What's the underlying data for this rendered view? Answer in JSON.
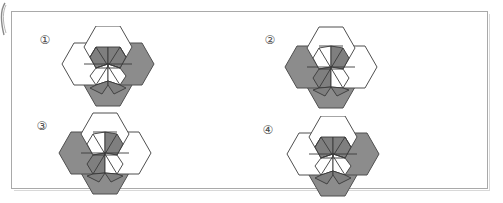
{
  "page": {
    "background_color": "#ffffff",
    "frame": {
      "border_color": "#a9a9a9",
      "shadow_color": "#d8d8d8"
    }
  },
  "palette": {
    "outline": "#4f4f4f",
    "inner_outline": "#3a3a3a",
    "shaded_fill": "#8c8c8c",
    "segment_dark": "#7f7f7f",
    "segment_mid": "#9a9a9a",
    "white_fill": "#ffffff",
    "label_color": "#4a4a4a"
  },
  "options": [
    {
      "id": "option-1",
      "label": "①",
      "orientation": "flat-top",
      "description": "Three overlapping hexagons: white hexagon upper-centre, white hexagon left, shaded hexagon right, shaded hexagon bottom; interior star of alternating light and dark wedge segments.",
      "hexagons": [
        {
          "name": "top-hexagon",
          "fill": "white"
        },
        {
          "name": "left-hexagon",
          "fill": "white"
        },
        {
          "name": "right-hexagon",
          "fill": "shaded"
        },
        {
          "name": "bottom-hexagon",
          "fill": "shaded"
        }
      ]
    },
    {
      "id": "option-2",
      "label": "②",
      "orientation": "pointy-top",
      "description": "Three overlapping hexagons: white hexagon top, shaded hexagon left, white hexagon right, shaded hexagon bottom; interior lattice of light and dark wedge segments.",
      "hexagons": [
        {
          "name": "top-hexagon",
          "fill": "white"
        },
        {
          "name": "left-hexagon",
          "fill": "shaded"
        },
        {
          "name": "right-hexagon",
          "fill": "white"
        },
        {
          "name": "bottom-hexagon",
          "fill": "shaded"
        }
      ]
    },
    {
      "id": "option-3",
      "label": "③",
      "orientation": "pointy-top",
      "description": "Three overlapping hexagons: white hexagon top, shaded hexagon left, white hexagon right, shaded hexagon bottom; interior lattice of light and dark wedge segments.",
      "hexagons": [
        {
          "name": "top-hexagon",
          "fill": "white"
        },
        {
          "name": "left-hexagon",
          "fill": "shaded"
        },
        {
          "name": "right-hexagon",
          "fill": "white"
        },
        {
          "name": "bottom-hexagon",
          "fill": "shaded"
        }
      ]
    },
    {
      "id": "option-4",
      "label": "④",
      "orientation": "flat-top",
      "description": "Three overlapping hexagons: white hexagon upper-centre, white hexagon left, shaded hexagon right, shaded hexagon bottom; interior star of alternating light and dark wedge segments.",
      "hexagons": [
        {
          "name": "top-hexagon",
          "fill": "white"
        },
        {
          "name": "left-hexagon",
          "fill": "white"
        },
        {
          "name": "right-hexagon",
          "fill": "shaded"
        },
        {
          "name": "bottom-hexagon",
          "fill": "shaded"
        }
      ]
    }
  ]
}
